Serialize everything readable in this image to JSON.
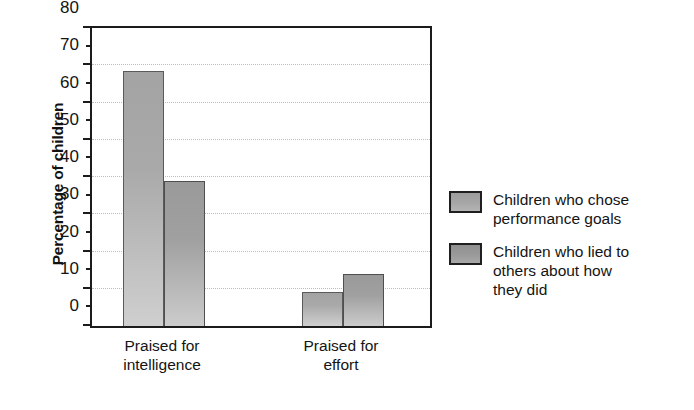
{
  "chart_data": {
    "type": "bar",
    "title": "",
    "xlabel": "",
    "ylabel": "Percentage of children",
    "categories": [
      "Praised for intelligence",
      "Praised for effort"
    ],
    "category_labels": [
      [
        "Praised for",
        "intelligence"
      ],
      [
        "Praised for",
        "effort"
      ]
    ],
    "series": [
      {
        "name": "Children who chose performance goals",
        "name_lines": [
          "Children who chose",
          "performance goals"
        ],
        "color": "#a6a6a6",
        "values": [
          68.5,
          9
        ]
      },
      {
        "name": "Children who lied to others about how they did",
        "name_lines": [
          "Children who lied to",
          "others about how",
          "they did"
        ],
        "color": "#9a9a9a",
        "values": [
          39,
          14
        ]
      }
    ],
    "ylim": [
      0,
      80
    ],
    "yticks": [
      0,
      10,
      20,
      30,
      40,
      50,
      60,
      70,
      80
    ],
    "ytick_labels": [
      "0",
      "10",
      "20",
      "30",
      "40",
      "50",
      "60",
      "70",
      "80"
    ],
    "yminor_ticks": [
      5,
      15,
      25,
      35,
      45,
      55,
      65,
      75
    ],
    "grid": true,
    "grid_axis": "y",
    "grid_style": "dotted",
    "legend_position": "right",
    "background_color": "#ffffff",
    "axis_color": "#1b1b1b"
  }
}
